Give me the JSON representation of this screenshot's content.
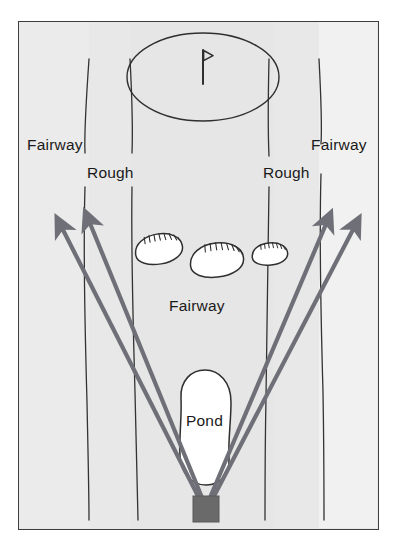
{
  "diagram": {
    "type": "golf-hole-schematic",
    "colors": {
      "frame_border": "#3e3e3e",
      "background_fairway": "#e9e9e9",
      "background_rough": "#ededed",
      "background_outer": "#f4f4f4",
      "arrow": "#6f6f78",
      "hazard_fill": "#ffffff",
      "hazard_outline": "#2f2f2f",
      "tee_box": "#6a6a6a",
      "boundary_line": "#2f2f2f",
      "page": "#ffffff",
      "text": "#1a1a1a"
    },
    "labels": {
      "fairway_left": "Fairway",
      "rough_left": "Rough",
      "rough_right": "Rough",
      "fairway_right": "Fairway",
      "fairway_center": "Fairway",
      "pond": "Pond"
    },
    "features": {
      "green": {
        "name": "green",
        "shape": "ellipse",
        "cx": 184,
        "cy": 55,
        "rx": 76,
        "ry": 44
      },
      "pin": {
        "name": "flagstick",
        "pole_x": 184,
        "pole_top": 27,
        "pole_bottom": 62,
        "flag_direction": "right"
      },
      "bunkers": [
        {
          "name": "bunker-left",
          "cx": 140,
          "cy": 227,
          "rx": 24,
          "ry": 15,
          "rotate": -12
        },
        {
          "name": "bunker-center",
          "cx": 198,
          "cy": 238,
          "rx": 27,
          "ry": 17,
          "rotate": -8
        },
        {
          "name": "bunker-right",
          "cx": 251,
          "cy": 232,
          "rx": 18,
          "ry": 11,
          "rotate": -8
        }
      ],
      "pond": {
        "name": "pond",
        "cx": 186,
        "cy": 405,
        "rx": 26,
        "ry": 57
      },
      "tee_box": {
        "name": "tee-box",
        "x": 174,
        "y": 474,
        "width": 26,
        "height": 26
      }
    },
    "shot_arrows": [
      {
        "name": "shot-arrow-far-left",
        "x1": 187,
        "y1": 478,
        "x2": 39,
        "y2": 198
      },
      {
        "name": "shot-arrow-inner-left",
        "x1": 189,
        "y1": 478,
        "x2": 67,
        "y2": 192
      },
      {
        "name": "shot-arrow-inner-right",
        "x1": 191,
        "y1": 478,
        "x2": 311,
        "y2": 193
      },
      {
        "name": "shot-arrow-far-right",
        "x1": 193,
        "y1": 478,
        "x2": 339,
        "y2": 198
      }
    ],
    "boundary_lines": [
      {
        "name": "boundary-left-outer",
        "x": 68
      },
      {
        "name": "boundary-left-inner",
        "x": 110
      },
      {
        "name": "boundary-right-inner",
        "x": 254
      },
      {
        "name": "boundary-right-outer",
        "x": 300
      }
    ]
  }
}
